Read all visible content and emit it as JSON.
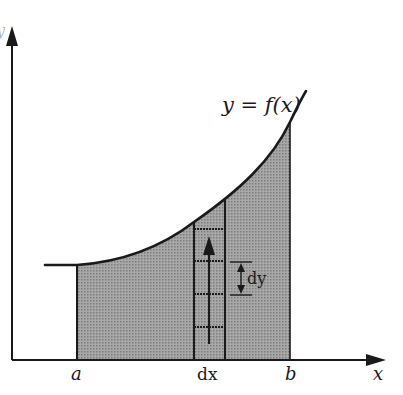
{
  "diagram": {
    "type": "area-under-curve",
    "curve_label": "y = f(x)",
    "x_axis_label": "x",
    "y_axis_label": "y",
    "lower_limit_label": "a",
    "upper_limit_label": "b",
    "strip_width_label": "dx",
    "element_height_label": "dy",
    "colors": {
      "ink": "#1a1a1a",
      "shade": "#9a9a9a",
      "background": "#ffffff"
    }
  }
}
